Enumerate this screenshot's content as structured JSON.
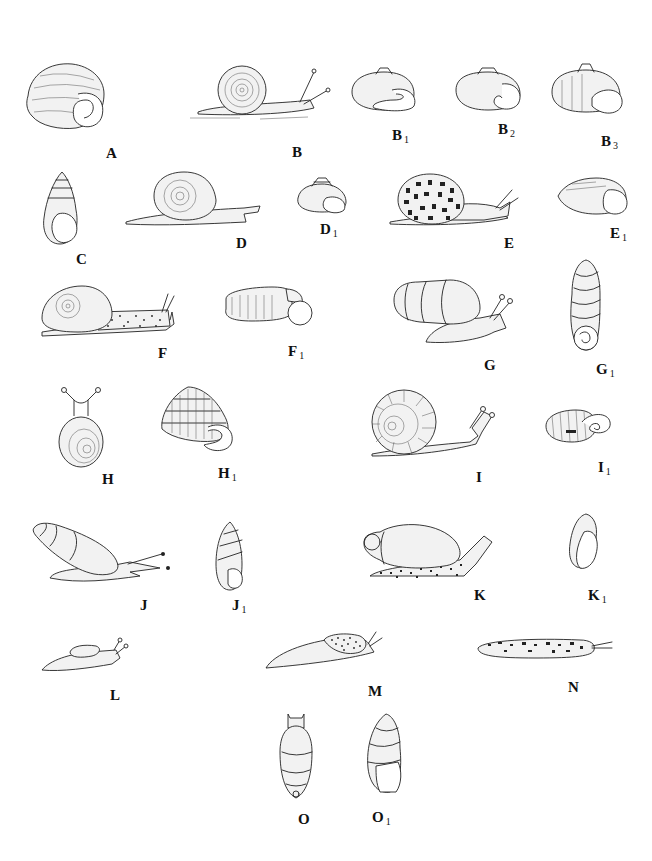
{
  "plate": {
    "width": 652,
    "height": 861,
    "background": "#ffffff",
    "ink": "#222222"
  },
  "figures": [
    {
      "id": "A",
      "main": "A",
      "sub": "",
      "kind": "shell-aperture-large",
      "box": [
        20,
        60,
        90,
        72
      ],
      "label_pos": [
        106,
        146
      ]
    },
    {
      "id": "B",
      "main": "B",
      "sub": "",
      "kind": "snail-planispiral",
      "box": [
        180,
        60,
        150,
        62
      ],
      "label_pos": [
        292,
        145
      ]
    },
    {
      "id": "B1",
      "main": "B",
      "sub": "1",
      "kind": "shell-depressed",
      "box": [
        348,
        68,
        72,
        44
      ],
      "label_pos": [
        392,
        128
      ]
    },
    {
      "id": "B2",
      "main": "B",
      "sub": "2",
      "kind": "shell-depressed",
      "box": [
        452,
        66,
        72,
        46
      ],
      "label_pos": [
        498,
        122
      ]
    },
    {
      "id": "B3",
      "main": "B",
      "sub": "3",
      "kind": "shell-globose",
      "box": [
        548,
        62,
        78,
        54
      ],
      "label_pos": [
        601,
        134
      ]
    },
    {
      "id": "C",
      "main": "C",
      "sub": "",
      "kind": "shell-fusiform",
      "box": [
        40,
        170,
        42,
        76
      ],
      "label_pos": [
        76,
        252
      ]
    },
    {
      "id": "D",
      "main": "D",
      "sub": "",
      "kind": "snail-planispiral",
      "box": [
        124,
        170,
        138,
        58
      ],
      "label_pos": [
        236,
        236
      ]
    },
    {
      "id": "D1",
      "main": "D",
      "sub": "1",
      "kind": "shell-trochoid",
      "box": [
        294,
        176,
        56,
        38
      ],
      "label_pos": [
        320,
        222
      ]
    },
    {
      "id": "E",
      "main": "E",
      "sub": "",
      "kind": "snail-spotted",
      "box": [
        384,
        172,
        140,
        60
      ],
      "label_pos": [
        504,
        236
      ]
    },
    {
      "id": "E1",
      "main": "E",
      "sub": "1",
      "kind": "shell-depressed",
      "box": [
        556,
        176,
        76,
        40
      ],
      "label_pos": [
        610,
        226
      ]
    },
    {
      "id": "F",
      "main": "F",
      "sub": "",
      "kind": "snail-long-foot",
      "box": [
        38,
        284,
        140,
        56
      ],
      "label_pos": [
        158,
        346
      ]
    },
    {
      "id": "F1",
      "main": "F",
      "sub": "1",
      "kind": "shell-discoid",
      "box": [
        222,
        283,
        92,
        44
      ],
      "label_pos": [
        288,
        344
      ]
    },
    {
      "id": "G",
      "main": "G",
      "sub": "",
      "kind": "snail-tall-shell",
      "box": [
        390,
        276,
        128,
        72
      ],
      "label_pos": [
        484,
        358
      ]
    },
    {
      "id": "G1",
      "main": "G",
      "sub": "1",
      "kind": "shell-pupiform",
      "box": [
        568,
        258,
        36,
        96
      ],
      "label_pos": [
        598,
        362
      ]
    },
    {
      "id": "H",
      "main": "H",
      "sub": "",
      "kind": "snail-top-view",
      "box": [
        56,
        386,
        50,
        82
      ],
      "label_pos": [
        102,
        472
      ]
    },
    {
      "id": "H1",
      "main": "H",
      "sub": "1",
      "kind": "shell-conical",
      "box": [
        158,
        385,
        80,
        70
      ],
      "label_pos": [
        218,
        466
      ]
    },
    {
      "id": "I",
      "main": "I",
      "sub": "",
      "kind": "snail-ribbed",
      "box": [
        364,
        388,
        138,
        70
      ],
      "label_pos": [
        476,
        470
      ]
    },
    {
      "id": "I1",
      "main": "I",
      "sub": "1",
      "kind": "shell-ribbed-flat",
      "box": [
        542,
        408,
        70,
        36
      ],
      "label_pos": [
        598,
        460
      ]
    },
    {
      "id": "J",
      "main": "J",
      "sub": "",
      "kind": "snail-elongate",
      "box": [
        30,
        520,
        140,
        66
      ],
      "label_pos": [
        140,
        598
      ]
    },
    {
      "id": "J1",
      "main": "J",
      "sub": "1",
      "kind": "shell-turreted",
      "box": [
        212,
        520,
        34,
        72
      ],
      "label_pos": [
        234,
        598
      ]
    },
    {
      "id": "K",
      "main": "K",
      "sub": "",
      "kind": "snail-oval-shell",
      "box": [
        360,
        518,
        138,
        62
      ],
      "label_pos": [
        476,
        588
      ]
    },
    {
      "id": "K1",
      "main": "K",
      "sub": "1",
      "kind": "shell-oval-small",
      "box": [
        566,
        512,
        36,
        58
      ],
      "label_pos": [
        588,
        588
      ]
    },
    {
      "id": "L",
      "main": "L",
      "sub": "",
      "kind": "semislug",
      "box": [
        40,
        638,
        90,
        36
      ],
      "label_pos": [
        110,
        688
      ]
    },
    {
      "id": "M",
      "main": "M",
      "sub": "",
      "kind": "slug",
      "box": [
        264,
        630,
        120,
        40
      ],
      "label_pos": [
        368,
        684
      ]
    },
    {
      "id": "N",
      "main": "N",
      "sub": "",
      "kind": "slug-flat-spotted",
      "box": [
        476,
        636,
        136,
        24
      ],
      "label_pos": [
        568,
        680
      ]
    },
    {
      "id": "O",
      "main": "O",
      "sub": "",
      "kind": "snail-top-elongate",
      "box": [
        278,
        712,
        36,
        90
      ],
      "label_pos": [
        298,
        812
      ]
    },
    {
      "id": "O1",
      "main": "O",
      "sub": "1",
      "kind": "shell-pupiform-large",
      "box": [
        364,
        712,
        40,
        82
      ],
      "label_pos": [
        372,
        810
      ]
    }
  ]
}
